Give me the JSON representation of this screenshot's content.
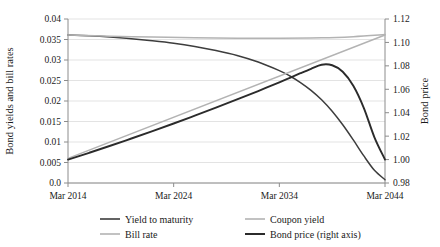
{
  "chart_data": {
    "type": "line",
    "title": "",
    "xlabel": "",
    "ylabel": "Bond yields and bill rates",
    "y2label": "Bond price",
    "x_tick_labels": [
      "Mar 2014",
      "Mar 2024",
      "Mar 2034",
      "Mar 2044"
    ],
    "x_tick_values": [
      2014,
      2024,
      2034,
      2044
    ],
    "xlim": [
      2014,
      2044
    ],
    "ylim": [
      0.0,
      0.04
    ],
    "y_tick_labels": [
      "0.0",
      "0.005",
      "0.01",
      "0.015",
      "0.02",
      "0.025",
      "0.03",
      "0.035",
      "0.04"
    ],
    "y_tick_values": [
      0.0,
      0.005,
      0.01,
      0.015,
      0.02,
      0.025,
      0.03,
      0.035,
      0.04
    ],
    "y2lim": [
      0.98,
      1.12
    ],
    "y2_tick_labels": [
      "0.98",
      "1.00",
      "1.02",
      "1.04",
      "1.06",
      "1.08",
      "1.10",
      "1.12"
    ],
    "y2_tick_values": [
      0.98,
      1.0,
      1.02,
      1.04,
      1.06,
      1.08,
      1.1,
      1.12
    ],
    "grid": "horizontal",
    "legend_position": "bottom",
    "colors": {
      "yield_to_maturity": "#3d3d3d",
      "coupon_yield": "#b3b3b3",
      "bill_rate": "#b3b3b3",
      "bond_price": "#2b2b2b",
      "gridline": "#dcdcdc",
      "axis": "#8c8c8c"
    },
    "series": [
      {
        "name": "Yield to maturity",
        "axis": "left",
        "color": "#3d3d3d",
        "x": [
          2014,
          2016,
          2018,
          2020,
          2022,
          2024,
          2026,
          2028,
          2030,
          2032,
          2034,
          2035,
          2036,
          2037,
          2038,
          2039,
          2040,
          2041,
          2042,
          2043,
          2044
        ],
        "values": [
          0.0361,
          0.0359,
          0.0356,
          0.0352,
          0.0347,
          0.0341,
          0.0333,
          0.0323,
          0.0311,
          0.0295,
          0.0274,
          0.0261,
          0.0245,
          0.0226,
          0.0203,
          0.0175,
          0.0142,
          0.0105,
          0.0066,
          0.0031,
          0.0008
        ]
      },
      {
        "name": "Coupon yield",
        "axis": "left",
        "color": "#b3b3b3",
        "x": [
          2014,
          2018,
          2022,
          2026,
          2030,
          2034,
          2038,
          2041,
          2044
        ],
        "values": [
          0.0361,
          0.0358,
          0.0356,
          0.0354,
          0.0353,
          0.0353,
          0.0354,
          0.0357,
          0.0362
        ]
      },
      {
        "name": "Bill rate",
        "axis": "left",
        "color": "#b3b3b3",
        "x": [
          2014,
          2044
        ],
        "values": [
          0.006,
          0.0361
        ]
      },
      {
        "name": "Bond price (right axis)",
        "axis": "right",
        "color": "#2b2b2b",
        "x": [
          2014,
          2016,
          2018,
          2020,
          2022,
          2024,
          2026,
          2028,
          2030,
          2032,
          2034,
          2035,
          2036,
          2037,
          2038,
          2039,
          2040,
          2041,
          2042,
          2043,
          2044
        ],
        "values": [
          1.0,
          1.0058,
          1.0118,
          1.018,
          1.0243,
          1.0308,
          1.0375,
          1.0443,
          1.0513,
          1.0585,
          1.066,
          1.0698,
          1.0737,
          1.0775,
          1.081,
          1.0805,
          1.075,
          1.063,
          1.044,
          1.019,
          1.0
        ]
      }
    ]
  },
  "legend": {
    "items": [
      {
        "label": "Yield to maturity",
        "color": "#3d3d3d",
        "width": 1.6
      },
      {
        "label": "Coupon yield",
        "color": "#b3b3b3",
        "width": 1.6
      },
      {
        "label": "Bill rate",
        "color": "#b3b3b3",
        "width": 1.6
      },
      {
        "label": "Bond price (right axis)",
        "color": "#2b2b2b",
        "width": 2.0
      }
    ]
  }
}
